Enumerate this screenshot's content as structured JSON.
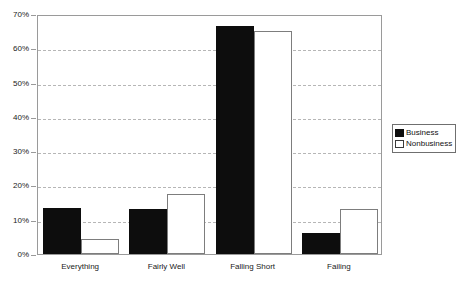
{
  "chart_data": {
    "type": "bar",
    "title": "",
    "xlabel": "",
    "ylabel": "",
    "categories": [
      "Everything",
      "Fairly Well",
      "Falling Short",
      "Failing"
    ],
    "series": [
      {
        "name": "Business",
        "color": "#0d0d0d",
        "values": [
          13.5,
          13.0,
          66.5,
          6.0
        ]
      },
      {
        "name": "Nonbusiness",
        "color": "#ffffff",
        "values": [
          4.5,
          17.5,
          65.0,
          13.0
        ]
      }
    ],
    "ylim": [
      0,
      70
    ],
    "ytick_values": [
      0,
      10,
      20,
      30,
      40,
      50,
      60,
      70
    ],
    "ytick_labels": [
      "0%",
      "10%",
      "20%",
      "30%",
      "40%",
      "50%",
      "60%",
      "70%"
    ],
    "grid": true,
    "grid_axis": "y",
    "grid_style": "dashed",
    "grid_color": "#b6b6b6",
    "legend_position": "right",
    "legend_entries": [
      "Business",
      "Nonbusiness"
    ],
    "plot_border_color": "#9a9a9a",
    "background_color": "#ffffff"
  }
}
